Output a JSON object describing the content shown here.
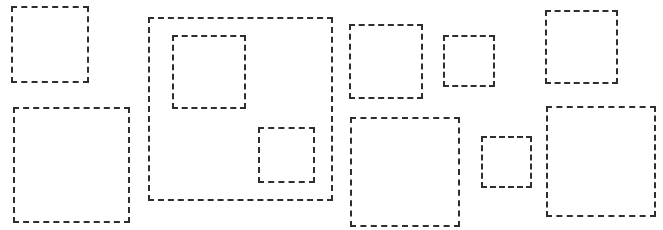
{
  "diagram": {
    "background": "#ffffff",
    "stroke_color": "#2e2e2e",
    "stroke_style": "dashed",
    "boxes": [
      {
        "id": "box-1",
        "x": 11,
        "y": 6,
        "w": 78,
        "h": 77
      },
      {
        "id": "box-2",
        "x": 13,
        "y": 107,
        "w": 117,
        "h": 116
      },
      {
        "id": "box-3-container",
        "x": 148,
        "y": 17,
        "w": 185,
        "h": 184
      },
      {
        "id": "box-3a-inner",
        "x": 172,
        "y": 35,
        "w": 74,
        "h": 74
      },
      {
        "id": "box-3b-inner",
        "x": 258,
        "y": 127,
        "w": 57,
        "h": 56
      },
      {
        "id": "box-4",
        "x": 349,
        "y": 24,
        "w": 74,
        "h": 75
      },
      {
        "id": "box-5",
        "x": 443,
        "y": 35,
        "w": 52,
        "h": 52
      },
      {
        "id": "box-6",
        "x": 350,
        "y": 117,
        "w": 110,
        "h": 110
      },
      {
        "id": "box-7",
        "x": 481,
        "y": 136,
        "w": 51,
        "h": 52
      },
      {
        "id": "box-8",
        "x": 545,
        "y": 10,
        "w": 73,
        "h": 74
      },
      {
        "id": "box-9",
        "x": 546,
        "y": 106,
        "w": 110,
        "h": 111
      }
    ]
  }
}
